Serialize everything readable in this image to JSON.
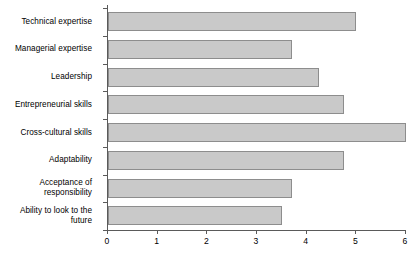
{
  "chart_data": {
    "type": "bar",
    "orientation": "horizontal",
    "title": "",
    "subtitle": "",
    "xlabel": "",
    "ylabel": "",
    "xlim": [
      0,
      6
    ],
    "grid": false,
    "legend": null,
    "bar_color": "#c9c9c9",
    "bar_border_color": "#8d8d8d",
    "axis_color": "#5a5a5a",
    "xticks": [
      0,
      1,
      2,
      3,
      4,
      5,
      6
    ],
    "xtick_labels": [
      "0",
      "1",
      "2",
      "3",
      "4",
      "5",
      "6"
    ],
    "categories": [
      "Technical expertise",
      "Managerial expertise",
      "Leadership",
      "Entrepreneurial skills",
      "Cross-cultural skills",
      "Adaptability",
      "Acceptance of\nresponsibility",
      "Ability to look to the\nfuture"
    ],
    "values": [
      5.0,
      3.7,
      4.25,
      4.75,
      6.0,
      4.75,
      3.7,
      3.5
    ]
  }
}
